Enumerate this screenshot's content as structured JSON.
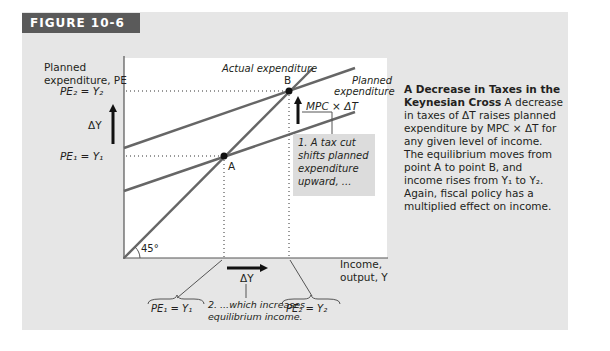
{
  "figure": {
    "label": "FIGURE 10-6",
    "colors": {
      "panel": "#e6e6e6",
      "label_bar": "#5a5a5a",
      "lines": "#555555",
      "plot_bg": "#ffffff"
    }
  },
  "axes": {
    "y_label_line1": "Planned",
    "y_label_line2": "expenditure, PE",
    "x_label_line1": "Income,",
    "x_label_line2": "output, Y",
    "angle_label": "45°"
  },
  "y_ticks": {
    "pe2": "PE₂ = Y₂",
    "pe1": "PE₁ = Y₁",
    "delta_y": "ΔY"
  },
  "lines": {
    "actual": "Actual expenditure",
    "planned_line1": "Planned",
    "planned_line2": "expenditure"
  },
  "points": {
    "a": "A",
    "b": "B"
  },
  "shift_label": "MPC × ΔT",
  "annotations": {
    "note1": [
      "1. A tax cut",
      "shifts planned",
      "expenditure",
      "upward, ..."
    ],
    "note2_line1": "2. ...which increases",
    "note2_line2": "equilibrium income.",
    "x_delta": "ΔY",
    "brace1": "PE₁ = Y₁",
    "brace2": "PE₂ = Y₂"
  },
  "caption": {
    "title": "A Decrease in Taxes in the Keynesian Cross",
    "body": "A decrease in taxes of ΔT raises planned expenditure by MPC × ΔT for any given level of income. The equilibrium moves from point A to point B, and income rises from Y₁ to Y₂. Again, fiscal policy has a multiplied effect on income."
  }
}
